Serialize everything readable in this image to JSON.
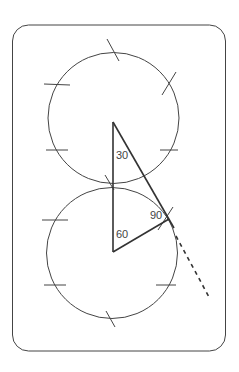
{
  "diagram": {
    "angles": {
      "top": "30",
      "right": "90",
      "bottom": "60"
    },
    "colors": {
      "stroke": "#333333",
      "background": "#ffffff"
    }
  }
}
